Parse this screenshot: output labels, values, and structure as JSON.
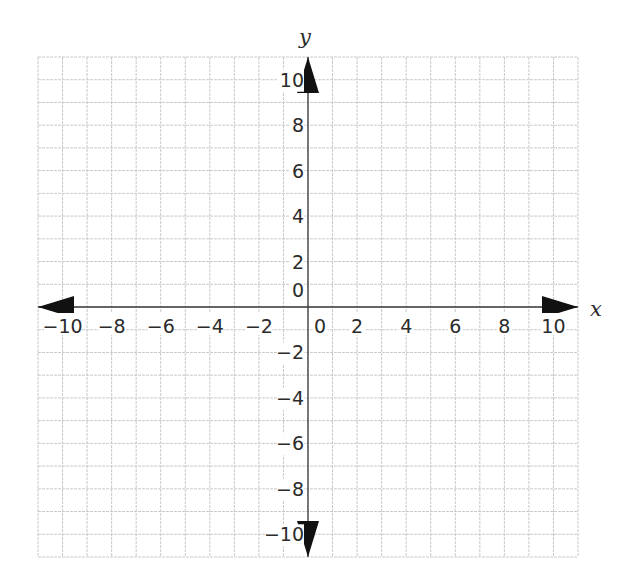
{
  "chart_data": {
    "type": "scatter",
    "title": "",
    "subtitle": "",
    "xlabel": "x",
    "ylabel": "y",
    "xlim": [
      -11,
      11
    ],
    "ylim": [
      -11,
      11
    ],
    "grid": true,
    "grid_step": 1,
    "x_ticks": [
      -10,
      -8,
      -6,
      -4,
      -2,
      0,
      2,
      4,
      6,
      8,
      10
    ],
    "x_tick_labels": [
      "−10",
      "−8",
      "−6",
      "−4",
      "−2",
      "0",
      "2",
      "4",
      "6",
      "8",
      "10"
    ],
    "y_ticks": [
      10,
      8,
      6,
      4,
      2,
      0,
      -2,
      -4,
      -6,
      -8,
      -10
    ],
    "y_tick_labels": [
      "10",
      "8",
      "6",
      "4",
      "2",
      "0",
      "−2",
      "−4",
      "−6",
      "−8",
      "−10"
    ],
    "axis_arrows": [
      "left",
      "right",
      "up",
      "down"
    ],
    "series": [],
    "legend": null
  },
  "colors": {
    "grid": "#c9c9c9",
    "axis": "#3a3a3a",
    "arrow": "#111111",
    "text": "#2b2b2b",
    "background": "#ffffff"
  },
  "labels": {
    "x_axis_name": "x",
    "y_axis_name": "y"
  }
}
